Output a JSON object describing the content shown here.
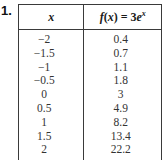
{
  "problem": {
    "number": "1."
  },
  "table": {
    "headers": {
      "x": "x",
      "f_prefix": "f",
      "f_open": "(",
      "f_var": "x",
      "f_close": ")",
      "f_equals": " = 3",
      "f_base": "e",
      "f_exp": "x"
    },
    "rows": [
      {
        "x": "−2",
        "fx": "0.4"
      },
      {
        "x": "−1.5",
        "fx": "0.7"
      },
      {
        "x": "−1",
        "fx": "1.1"
      },
      {
        "x": "−0.5",
        "fx": "1.8"
      },
      {
        "x": "0",
        "fx": "3"
      },
      {
        "x": "0.5",
        "fx": "4.9"
      },
      {
        "x": "1",
        "fx": "8.2"
      },
      {
        "x": "1.5",
        "fx": "13.4"
      },
      {
        "x": "2",
        "fx": "22.2"
      }
    ]
  }
}
